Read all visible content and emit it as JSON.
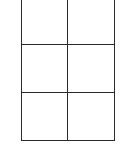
{
  "diagram": {
    "type": "grid",
    "rows": 3,
    "columns": 2,
    "top_border_visible": false,
    "line_color": "#2a2a2a",
    "background": "#ffffff",
    "cells": [
      {
        "row": 1,
        "col": 1,
        "text": ""
      },
      {
        "row": 1,
        "col": 2,
        "text": ""
      },
      {
        "row": 2,
        "col": 1,
        "text": ""
      },
      {
        "row": 2,
        "col": 2,
        "text": ""
      },
      {
        "row": 3,
        "col": 1,
        "text": ""
      },
      {
        "row": 3,
        "col": 2,
        "text": ""
      }
    ]
  }
}
